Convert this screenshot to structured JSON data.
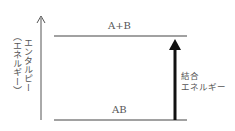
{
  "diagram": {
    "axis": {
      "label": "エンタルピー",
      "sublabel": "（エネルギー）"
    },
    "levels": [
      {
        "label": "A+B",
        "position": "upper"
      },
      {
        "label": "AB",
        "position": "lower"
      }
    ],
    "arrow": {
      "label_line1": "結合",
      "label_line2": "エネルギー",
      "direction": "up"
    },
    "colors": {
      "line": "#444444",
      "arrow": "#111111"
    }
  }
}
